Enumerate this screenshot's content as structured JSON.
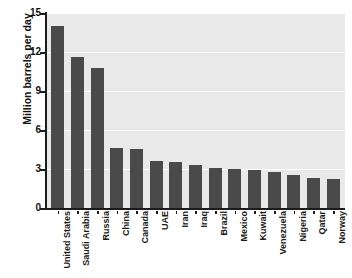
{
  "chart_data": {
    "type": "bar",
    "title": "Petroleum Production",
    "xlabel": "",
    "ylabel": "Million barrels per day",
    "ylim": [
      0,
      15
    ],
    "yticks": [
      15,
      12,
      9,
      6,
      3,
      0
    ],
    "grid": true,
    "legend": false,
    "bar_color": "#4a4a4a",
    "plot_background": "#e9e9e9",
    "gridline_color": "#ffffff",
    "categories": [
      "United States",
      "Saudi Arabia",
      "Russia",
      "China",
      "Canada",
      "UAE",
      "Iran",
      "Iraq",
      "Brazil",
      "Mexico",
      "Kuwait",
      "Venezuela",
      "Nigeria",
      "Qatar",
      "Norway"
    ],
    "values": [
      14.0,
      11.6,
      10.8,
      4.6,
      4.5,
      3.6,
      3.5,
      3.3,
      3.1,
      3.0,
      2.9,
      2.8,
      2.5,
      2.3,
      2.2
    ]
  }
}
